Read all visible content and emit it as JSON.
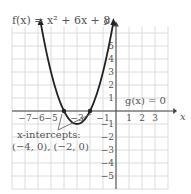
{
  "function_label": "f(x) = x² + 6x + 8",
  "g_label": "g(x) = 0",
  "x_axis_label": "x",
  "y_axis_label": "y",
  "x_ticks": [
    "−7",
    "−6",
    "−5",
    "−3",
    "−1",
    "1",
    "2",
    "3"
  ],
  "x_tick_values": [
    -7,
    -6,
    -5,
    -3,
    -1,
    1,
    2,
    3
  ],
  "y_ticks": [
    "1",
    "2",
    "3",
    "4",
    "5",
    "−1",
    "−2",
    "−3",
    "−4",
    "−5"
  ],
  "y_tick_values": [
    1,
    2,
    3,
    4,
    5,
    -1,
    -2,
    -3,
    -4,
    -5
  ],
  "annotation_line1": "x-intercepts:",
  "annotation_line2": "(−4, 0), (−2, 0)",
  "intercepts": [
    [
      -4,
      0
    ],
    [
      -2,
      0
    ]
  ],
  "vertex": [
    -3,
    -1
  ],
  "colors": {
    "grid": "#dcdcdc",
    "curve": "#222222",
    "axis": "#444444",
    "text": "#555555"
  }
}
